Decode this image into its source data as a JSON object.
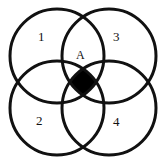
{
  "figure": {
    "kind": "four-circle-venn-diagram",
    "background_color": "#ffffff",
    "stroke_color": "#111111",
    "fill_color": "#ffffff",
    "intersection_fill_color": "#000000",
    "stroke_width": 3,
    "width": 165,
    "height": 166,
    "circles": [
      {
        "name": "circle-top-left",
        "cx": 57,
        "cy": 56,
        "r": 47
      },
      {
        "name": "circle-top-right",
        "cx": 109,
        "cy": 56,
        "r": 47
      },
      {
        "name": "circle-bottom-left",
        "cx": 57,
        "cy": 108,
        "r": 47
      },
      {
        "name": "circle-bottom-right",
        "cx": 109,
        "cy": 108,
        "r": 47
      }
    ],
    "labels": {
      "region_1": "1",
      "region_2": "2",
      "region_3": "3",
      "region_4": "4",
      "region_A": "A"
    },
    "label_positions": {
      "region_1": {
        "x": 38,
        "y": 30
      },
      "region_3": {
        "x": 113,
        "y": 30
      },
      "region_2": {
        "x": 36,
        "y": 114
      },
      "region_4": {
        "x": 113,
        "y": 115
      },
      "region_A": {
        "x": 76,
        "y": 49
      }
    }
  }
}
